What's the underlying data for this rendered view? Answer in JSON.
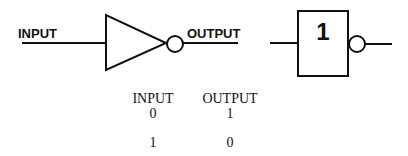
{
  "symbol_left": {
    "input_label": "INPUT",
    "output_label": "OUTPUT"
  },
  "symbol_right": {
    "box_label": "1"
  },
  "truth_table": {
    "headers": [
      "INPUT",
      "OUTPUT"
    ],
    "rows": [
      [
        "0",
        "1"
      ],
      [
        "1",
        "0"
      ]
    ]
  },
  "colors": {
    "stroke": "#111111",
    "background": "#ffffff"
  }
}
